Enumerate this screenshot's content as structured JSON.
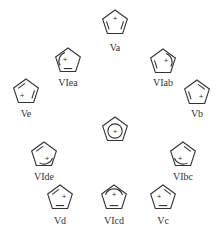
{
  "diagram": {
    "type": "resonance-structures",
    "stroke_color": "#333333",
    "background": "#ffffff",
    "center": {
      "id": "center",
      "label": "",
      "x": 115,
      "y": 130,
      "charge": "+",
      "style": "delocalized-circle"
    },
    "structures": [
      {
        "id": "Va",
        "label": "Va",
        "x": 115,
        "y": 23,
        "label_y": 51,
        "charge": "+",
        "plus_dx": 0,
        "plus_dy": -5,
        "double_bonds": [
          [
            1,
            2
          ],
          [
            3,
            4
          ]
        ],
        "arc": null
      },
      {
        "id": "VIea",
        "label": "VIea",
        "x": 68,
        "y": 61,
        "label_y": 86,
        "charge": "+",
        "plus_dx": -3,
        "plus_dy": -2,
        "double_bonds": [
          [
            2,
            3
          ]
        ],
        "arc": "left"
      },
      {
        "id": "VIab",
        "label": "VIab",
        "x": 163,
        "y": 62,
        "label_y": 86,
        "charge": "+",
        "plus_dx": 3,
        "plus_dy": -2,
        "double_bonds": [
          [
            3,
            4
          ]
        ],
        "arc": "right"
      },
      {
        "id": "Ve",
        "label": "Ve",
        "x": 26,
        "y": 92,
        "label_y": 117,
        "charge": "+",
        "plus_dx": -4,
        "plus_dy": 3,
        "double_bonds": [
          [
            4,
            0
          ],
          [
            1,
            2
          ]
        ],
        "arc": null
      },
      {
        "id": "Vb",
        "label": "Vb",
        "x": 197,
        "y": 93,
        "label_y": 117,
        "charge": "+",
        "plus_dx": 4,
        "plus_dy": 3,
        "double_bonds": [
          [
            0,
            1
          ],
          [
            3,
            4
          ]
        ],
        "arc": null
      },
      {
        "id": "VIde",
        "label": "VIde",
        "x": 44,
        "y": 155,
        "label_y": 180,
        "charge": "+",
        "plus_dx": 3,
        "plus_dy": 3,
        "double_bonds": [
          [
            4,
            0
          ]
        ],
        "arc": "bottom-right"
      },
      {
        "id": "VIbc",
        "label": "VIbc",
        "x": 183,
        "y": 155,
        "label_y": 180,
        "charge": "+",
        "plus_dx": -3,
        "plus_dy": 3,
        "double_bonds": [
          [
            0,
            1
          ]
        ],
        "arc": "bottom-left"
      },
      {
        "id": "Vd",
        "label": "Vd",
        "x": 60,
        "y": 198,
        "label_y": 224,
        "charge": "+",
        "plus_dx": 4,
        "plus_dy": -2,
        "double_bonds": [
          [
            4,
            0
          ],
          [
            2,
            3
          ]
        ],
        "arc": null
      },
      {
        "id": "VIcd",
        "label": "VIcd",
        "x": 114,
        "y": 198,
        "label_y": 224,
        "charge": "+",
        "plus_dx": 0,
        "plus_dy": -4,
        "double_bonds": [
          [
            2,
            3
          ]
        ],
        "arc": "top"
      },
      {
        "id": "Vc",
        "label": "Vc",
        "x": 163,
        "y": 198,
        "label_y": 224,
        "charge": "+",
        "plus_dx": -4,
        "plus_dy": -2,
        "double_bonds": [
          [
            0,
            1
          ],
          [
            2,
            3
          ]
        ],
        "arc": null
      }
    ]
  }
}
